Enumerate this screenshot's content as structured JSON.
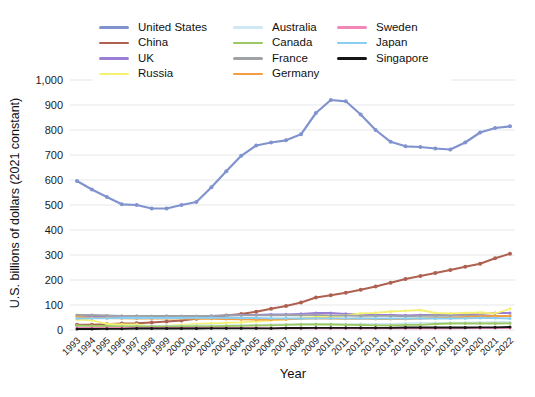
{
  "chart_data": {
    "type": "line",
    "title": "",
    "xlabel": "Year",
    "ylabel": "U.S. billions of dollars (2021 constant)",
    "x": [
      "1993",
      "1994",
      "1995",
      "1996",
      "1997",
      "1998",
      "1999",
      "2000",
      "2001",
      "2002",
      "2003",
      "2004",
      "2005",
      "2006",
      "2007",
      "2008",
      "2009",
      "2010",
      "2011",
      "2012",
      "2013",
      "2014",
      "2015",
      "2016",
      "2017",
      "2018",
      "2019",
      "2020",
      "2021",
      "2022"
    ],
    "ylim": [
      0,
      1000
    ],
    "ytick_interval": 100,
    "ytick_labels": [
      "0",
      "100",
      "200",
      "300",
      "400",
      "500",
      "600",
      "700",
      "800",
      "900",
      "1,000"
    ],
    "grid": true,
    "grid_color": "#e4e7ea",
    "legend_position": "top-center",
    "legend_columns": [
      4,
      4,
      3
    ],
    "series": [
      {
        "name": "United States",
        "color": "#8193ce",
        "values": [
          596,
          562,
          532,
          503,
          500,
          486,
          486,
          500,
          512,
          571,
          635,
          697,
          738,
          750,
          759,
          783,
          868,
          920,
          915,
          862,
          800,
          753,
          735,
          732,
          726,
          722,
          750,
          790,
          808,
          815
        ]
      },
      {
        "name": "China",
        "color": "#ae6150",
        "values": [
          21,
          21,
          23,
          26,
          27,
          30,
          34,
          38,
          45,
          53,
          58,
          64,
          73,
          85,
          96,
          110,
          130,
          139,
          149,
          161,
          174,
          189,
          204,
          216,
          228,
          240,
          253,
          265,
          287,
          305
        ]
      },
      {
        "name": "UK",
        "color": "#9a7fd6",
        "values": [
          58,
          55,
          52,
          51,
          50,
          49,
          50,
          51,
          53,
          56,
          59,
          60,
          61,
          62,
          63,
          65,
          68,
          68,
          65,
          62,
          61,
          60,
          59,
          60,
          61,
          61,
          62,
          65,
          68,
          68
        ]
      },
      {
        "name": "Russia",
        "color": "#f4f173",
        "values": [
          42,
          39,
          24,
          22,
          23,
          14,
          16,
          21,
          24,
          27,
          29,
          31,
          35,
          39,
          43,
          49,
          52,
          54,
          58,
          66,
          69,
          74,
          77,
          80,
          68,
          66,
          68,
          70,
          66,
          85
        ]
      },
      {
        "name": "Australia",
        "color": "#cfe8f4",
        "values": [
          15,
          15,
          15,
          15,
          16,
          16,
          17,
          17,
          18,
          18,
          19,
          20,
          21,
          22,
          23,
          24,
          25,
          25,
          25,
          25,
          24,
          25,
          27,
          29,
          29,
          29,
          30,
          31,
          32,
          32
        ]
      },
      {
        "name": "Canada",
        "color": "#9cc963",
        "values": [
          18,
          17,
          16,
          15,
          14,
          14,
          15,
          15,
          15,
          15,
          16,
          17,
          18,
          19,
          21,
          22,
          23,
          22,
          21,
          20,
          19,
          18,
          21,
          21,
          24,
          26,
          26,
          27,
          26,
          27
        ]
      },
      {
        "name": "France",
        "color": "#9ea2a6",
        "values": [
          60,
          60,
          58,
          57,
          57,
          56,
          57,
          56,
          56,
          57,
          58,
          59,
          59,
          59,
          60,
          59,
          61,
          59,
          58,
          57,
          57,
          57,
          55,
          57,
          58,
          57,
          59,
          59,
          57,
          57
        ]
      },
      {
        "name": "Germany",
        "color": "#f49d43",
        "values": [
          52,
          49,
          48,
          47,
          46,
          46,
          47,
          46,
          45,
          45,
          44,
          43,
          42,
          42,
          43,
          45,
          47,
          46,
          45,
          46,
          44,
          44,
          44,
          46,
          48,
          48,
          52,
          55,
          56,
          56
        ]
      },
      {
        "name": "Sweden",
        "color": "#f287b7",
        "values": [
          9,
          9,
          9,
          9,
          9,
          9,
          9,
          9,
          8,
          8,
          8,
          8,
          8,
          7,
          7,
          7,
          7,
          7,
          7,
          7,
          7,
          7,
          7,
          7,
          7,
          7,
          8,
          8,
          8,
          8
        ]
      },
      {
        "name": "Japan",
        "color": "#88cff1",
        "values": [
          46,
          47,
          47,
          48,
          48,
          48,
          48,
          48,
          49,
          49,
          49,
          48,
          48,
          47,
          47,
          46,
          47,
          47,
          47,
          46,
          46,
          46,
          46,
          47,
          46,
          46,
          47,
          48,
          48,
          46
        ]
      },
      {
        "name": "Singapore",
        "color": "#151515",
        "values": [
          4,
          4,
          5,
          5,
          6,
          6,
          6,
          6,
          6,
          7,
          7,
          7,
          7,
          7,
          8,
          8,
          9,
          9,
          9,
          9,
          9,
          9,
          10,
          10,
          10,
          10,
          10,
          11,
          11,
          12
        ]
      }
    ]
  }
}
